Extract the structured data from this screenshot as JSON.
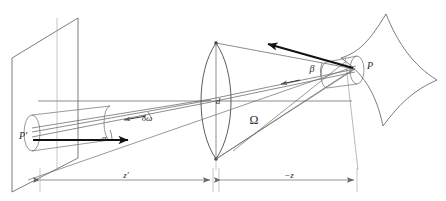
{
  "figure": {
    "type": "optical-ray-diagram",
    "background_color": "#ffffff",
    "line_color": "#555555",
    "bold_line_color": "#111111",
    "label_color": "#2b2b2b"
  },
  "labels": {
    "image_point": "P'",
    "object_point": "P",
    "aperture": "d",
    "solid_angle": "Ω",
    "angle_alpha": "α",
    "angle_beta": "β",
    "solid_angle_element": "δω",
    "distance_image": "z'",
    "distance_object": "−z"
  },
  "elements": {
    "image_plane": "parallelogram-plane",
    "lens": "biconvex-lens",
    "object_surface": "curved-astroid-surface",
    "left_beam": "elliptical-cylinder-beam",
    "right_beam": "elliptical-cylinder-beam",
    "optical_axis": "horizontal-axis-line",
    "arrow_left": "bold-arrow-pointing-right",
    "arrow_right": "bold-arrow-pointing-upper-left"
  },
  "dimension_lines": [
    {
      "name": "z-prime",
      "label": "z'",
      "from": "image-plane",
      "to": "lens"
    },
    {
      "name": "minus-z",
      "label": "−z",
      "from": "lens",
      "to": "object-surface"
    }
  ]
}
